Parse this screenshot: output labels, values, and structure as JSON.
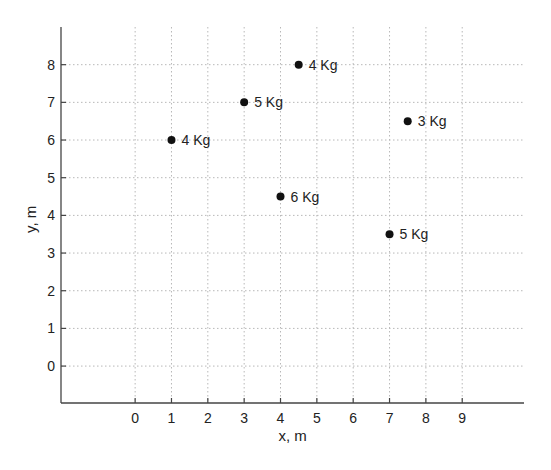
{
  "chart_data": {
    "type": "scatter",
    "title": "",
    "xlabel": "x, m",
    "ylabel": "y, m",
    "xlim": [
      -2.04,
      10.7
    ],
    "ylim": [
      -0.98,
      9.0
    ],
    "xticks": [
      0,
      1,
      2,
      3,
      4,
      5,
      6,
      7,
      8,
      9
    ],
    "yticks": [
      0,
      1,
      2,
      3,
      4,
      5,
      6,
      7,
      8
    ],
    "grid": true,
    "legend": null,
    "points": [
      {
        "x": 1,
        "y": 6,
        "label": "4 Kg"
      },
      {
        "x": 3,
        "y": 7,
        "label": "5 Kg"
      },
      {
        "x": 4.5,
        "y": 8,
        "label": "4 Kg"
      },
      {
        "x": 7.5,
        "y": 6.5,
        "label": "3 Kg"
      },
      {
        "x": 4,
        "y": 4.5,
        "label": "6 Kg"
      },
      {
        "x": 7,
        "y": 3.5,
        "label": "5 Kg"
      }
    ]
  }
}
